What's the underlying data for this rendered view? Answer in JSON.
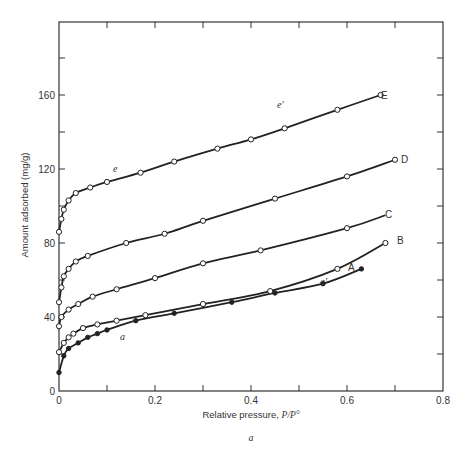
{
  "chart_data": {
    "type": "line",
    "title": "",
    "caption": "a",
    "xlabel": "Relative pressure, P/P°",
    "ylabel": "Amount adsorbed (mg/g)",
    "xlim": [
      0,
      0.8
    ],
    "ylim": [
      0,
      190
    ],
    "x_ticks": [
      0,
      0.2,
      0.4,
      0.6,
      0.8
    ],
    "x_tick_labels": [
      "0",
      "0.2",
      "0.4",
      "0.6",
      "0.8"
    ],
    "y_ticks": [
      0,
      40,
      80,
      120,
      160
    ],
    "y_tick_labels": [
      "0",
      "40",
      "80",
      "120",
      "160"
    ],
    "grid": false,
    "legend": "curve labels at line ends (A–E)",
    "series": [
      {
        "name": "E",
        "marker": "open-circle",
        "x": [
          0.0,
          0.005,
          0.01,
          0.02,
          0.035,
          0.065,
          0.1,
          0.17,
          0.24,
          0.33,
          0.4,
          0.47,
          0.58,
          0.67
        ],
        "y": [
          86,
          93,
          98,
          103,
          107,
          110,
          113,
          118,
          124,
          131,
          136,
          142,
          152,
          160
        ],
        "annotations": [
          {
            "x": 0.12,
            "y": 116,
            "text": "e"
          },
          {
            "x": 0.45,
            "y": 147,
            "text": "e'"
          }
        ]
      },
      {
        "name": "D",
        "marker": "open-circle",
        "x": [
          0.0,
          0.005,
          0.01,
          0.02,
          0.035,
          0.06,
          0.14,
          0.22,
          0.3,
          0.45,
          0.6,
          0.7
        ],
        "y": [
          48,
          56,
          62,
          66,
          70,
          73,
          80,
          85,
          92,
          104,
          116,
          125
        ],
        "annotations": []
      },
      {
        "name": "C",
        "marker": "open-circle",
        "x": [
          0.0,
          0.005,
          0.02,
          0.04,
          0.07,
          0.12,
          0.2,
          0.3,
          0.42,
          0.6,
          0.68
        ],
        "y": [
          35,
          40,
          44,
          47,
          51,
          55,
          61,
          69,
          76,
          88,
          95
        ],
        "annotations": []
      },
      {
        "name": "B",
        "marker": "open-circle",
        "x": [
          0.0,
          0.01,
          0.02,
          0.03,
          0.05,
          0.08,
          0.12,
          0.18,
          0.3,
          0.44,
          0.58,
          0.68
        ],
        "y": [
          21,
          26,
          29,
          31,
          34,
          36,
          38,
          41,
          47,
          54,
          66,
          80
        ],
        "annotations": []
      },
      {
        "name": "A",
        "marker": "filled-circle",
        "x": [
          0.0,
          0.01,
          0.02,
          0.04,
          0.06,
          0.08,
          0.1,
          0.16,
          0.24,
          0.36,
          0.45,
          0.55,
          0.63
        ],
        "y": [
          10,
          19,
          23,
          26,
          29,
          31,
          33,
          38,
          42,
          48,
          53,
          58,
          66
        ],
        "annotations": [
          {
            "x": 0.085,
            "y": 27,
            "text": "a"
          },
          {
            "x": 0.6,
            "y": 55,
            "text": "a'"
          }
        ]
      }
    ]
  },
  "labels": {
    "y_axis_title": "Amount adsorbed (mg/g)",
    "x_axis_title_text": "Relative pressure, ",
    "x_axis_title_math": "P/P°",
    "caption": "a",
    "curve_E": "E",
    "curve_D": "D",
    "curve_C": "C",
    "curve_B": "B",
    "curve_A": "A",
    "ann_e": "e",
    "ann_e_prime": "e'",
    "ann_a": "a",
    "ann_a_prime": "a'"
  }
}
